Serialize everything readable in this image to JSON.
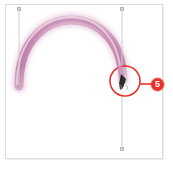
{
  "app": {
    "title": "Paint canvas with brush stroke",
    "canvas_background": "#ffffff",
    "frame_border_color": "#dcdcdc"
  },
  "artwork": {
    "stroke_name": "pink arc brush stroke",
    "stroke_color": "#c98fb4",
    "stroke_color_light": "#dcb2cd",
    "stroke_color_core": "#b97aa6",
    "stroke_width": "9",
    "shape": "semicircular arc opening downward"
  },
  "guides": [
    {
      "id": "guide-a",
      "label": "left vertical guide",
      "x": 19,
      "y_top": 9,
      "y_bottom": 86,
      "color": "#cfcfcf"
    },
    {
      "id": "guide-b",
      "label": "right vertical guide",
      "x": 122,
      "y_top": 9,
      "y_bottom": 149,
      "color": "#cfcfcf"
    }
  ],
  "annotation": {
    "badge_number": "5",
    "badge_color": "#e8322a",
    "circle_color": "#e8322a",
    "circle_center_x": 125,
    "circle_center_y": 81,
    "circle_radius": 15,
    "leader_line_from_x": 140,
    "leader_line_to_x": 152,
    "leader_line_y": 84,
    "target_label": "brush stroke endpoint with cursor"
  },
  "cursor": {
    "name": "brush-cursor",
    "color": "#2b2b2b",
    "x": 124,
    "y": 82
  }
}
